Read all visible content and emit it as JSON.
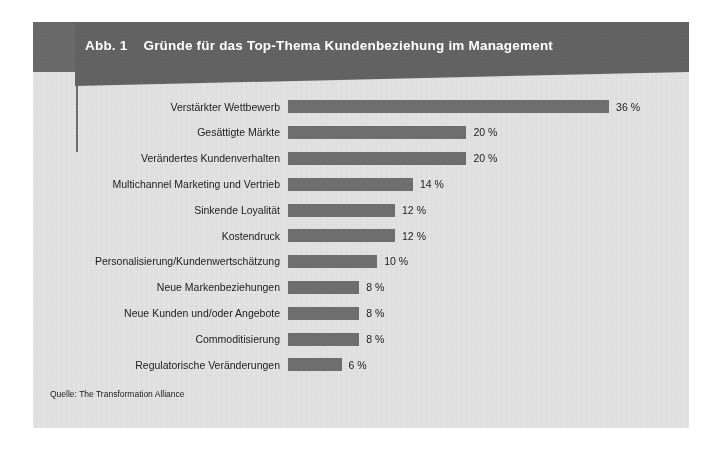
{
  "figure": {
    "number_label": "Abb. 1",
    "title": "Gründe für das Top-Thema Kundenbeziehung im Management",
    "source": "Quelle: The Transformation Alliance"
  },
  "colors": {
    "header_band": "#636363",
    "header_left_block": "#6a6a6a",
    "bar": "#6e6e6e",
    "background": "#e3e3e3",
    "text": "#1c1c1c",
    "title_text": "#ffffff"
  },
  "chart_data": {
    "type": "bar",
    "orientation": "horizontal",
    "title": "Gründe für das Top-Thema Kundenbeziehung im Management",
    "xlabel": "",
    "ylabel": "",
    "xlim": [
      0,
      36
    ],
    "grid": false,
    "legend": false,
    "value_suffix": "%",
    "categories": [
      "Verstärkter Wettbewerb",
      "Gesättigte Märkte",
      "Verändertes Kundenverhalten",
      "Multichannel Marketing und Vertrieb",
      "Sinkende Loyalität",
      "Kostendruck",
      "Personalisierung/Kundenwertschätzung",
      "Neue Markenbeziehungen",
      "Neue Kunden und/oder Angebote",
      "Commoditisierung",
      "Regulatorische Veränderungen"
    ],
    "values": [
      36,
      20,
      20,
      14,
      12,
      12,
      10,
      8,
      8,
      8,
      6
    ],
    "value_labels": [
      "36 %",
      "20 %",
      "20 %",
      "14 %",
      "12 %",
      "12 %",
      "10 %",
      "8 %",
      "8 %",
      "8 %",
      "6 %"
    ]
  }
}
